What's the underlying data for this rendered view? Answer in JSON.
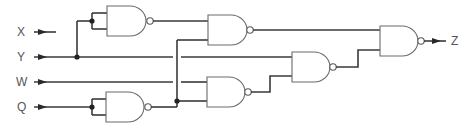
{
  "diagram": {
    "type": "logic-circuit",
    "gate_type": "NAND",
    "inputs": [
      {
        "id": "x",
        "label": "X"
      },
      {
        "id": "y",
        "label": "Y"
      },
      {
        "id": "w",
        "label": "W"
      },
      {
        "id": "q",
        "label": "Q"
      }
    ],
    "output": {
      "id": "z",
      "label": "Z"
    },
    "gates": [
      {
        "id": "g1",
        "type": "NAND",
        "inputs": [
          "Y",
          "Y"
        ],
        "note": "inverter (both inputs tied to Y)"
      },
      {
        "id": "g2",
        "type": "NAND",
        "inputs": [
          "g1",
          "g4"
        ]
      },
      {
        "id": "g4",
        "type": "NAND",
        "inputs": [
          "Q",
          "Q"
        ],
        "note": "inverter (both inputs tied to Q)"
      },
      {
        "id": "g5",
        "type": "NAND",
        "inputs": [
          "W",
          "g4"
        ]
      },
      {
        "id": "g3",
        "type": "NAND",
        "inputs": [
          "Y",
          "g5"
        ]
      },
      {
        "id": "g6",
        "type": "NAND",
        "inputs": [
          "g2",
          "g3"
        ],
        "output": "Z"
      }
    ],
    "colors": {
      "wire": "#3a3a3a",
      "gate_outline": "#6a6a6a",
      "label": "#555555",
      "background": "#ffffff"
    }
  }
}
